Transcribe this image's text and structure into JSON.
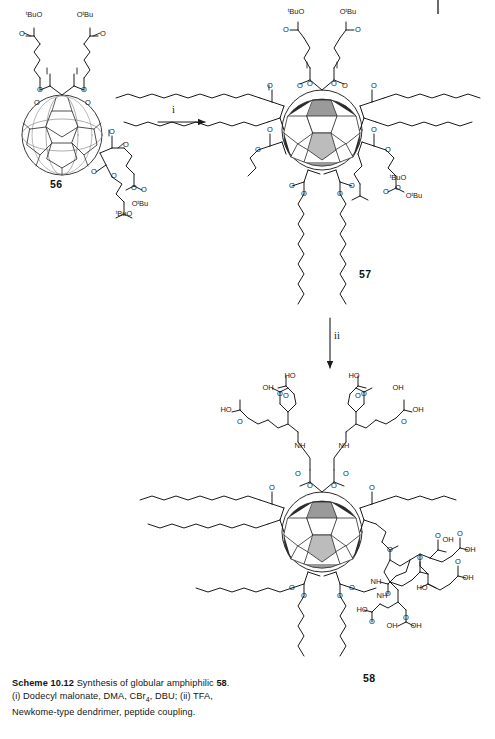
{
  "page": {
    "width": 495,
    "height": 739,
    "background": "#ffffff",
    "ink": "#1a1a1a"
  },
  "caption": {
    "scheme_label": "Scheme 10.12",
    "title_text": "Synthesis of globular amphiphilic",
    "title_compound": "58",
    "title_period": ".",
    "conditions_line1_a": "(i) Dodecyl malonate, DMA, CBr",
    "conditions_line1_sub": "4",
    "conditions_line1_b": ", DBU; (ii) TFA,",
    "conditions_line2": "Newkome-type dendrimer, peptide coupling."
  },
  "reagents": {
    "step_i": "i",
    "step_ii": "ii"
  },
  "compounds": {
    "start": {
      "number": "56",
      "name": "bis-malonate C60 adduct",
      "ester_labels": [
        "tBuO",
        "OtBu",
        "tBuO",
        "OtBu"
      ]
    },
    "intermediate": {
      "number": "57",
      "name": "hexakis-adduct with dodecyl chains",
      "ester_labels": [
        "tBuO",
        "OtBu",
        "tBuO",
        "OtBu"
      ]
    },
    "product": {
      "number": "58",
      "name": "globular amphiphile with Newkome dendrons",
      "acid_labels": [
        "HO",
        "OH",
        "HO",
        "OH",
        "HO",
        "OH",
        "HO",
        "OH",
        "OH",
        "OH",
        "HO",
        "OH",
        "OH",
        "HO",
        "OH",
        "OH"
      ],
      "amide_labels": [
        "NH",
        "NH",
        "NH",
        "NH"
      ]
    }
  },
  "atoms": {
    "oxygen": "O",
    "hydroxyl_left": "HO",
    "hydroxyl_right": "OH",
    "amide": "NH",
    "tbu_left": "tBuO",
    "tbu_right": "OtBu"
  }
}
